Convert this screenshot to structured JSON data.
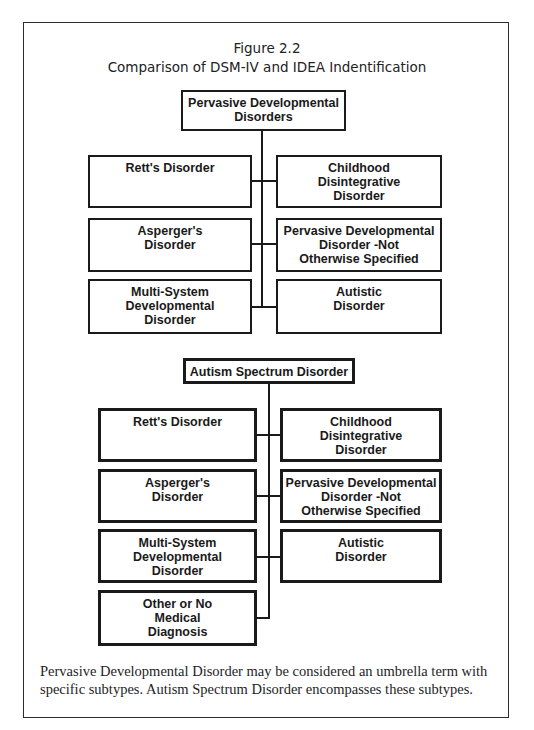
{
  "figure": {
    "number": "Figure 2.2",
    "title": "Comparison of DSM-IV and IDEA Indentification"
  },
  "dsm_diagram": {
    "root": "Pervasive Developmental\nDisorders",
    "children": [
      "Rett's Disorder",
      "Childhood\nDisintegrative\nDisorder",
      "Asperger's\nDisorder",
      "Pervasive Developmental\nDisorder -Not\nOtherwise Specified",
      "Multi-System\nDevelopmental\nDisorder",
      "Autistic\nDisorder"
    ]
  },
  "idea_diagram": {
    "root": "Autism Spectrum Disorder",
    "children": [
      "Rett's Disorder",
      "Childhood\nDisintegrative\nDisorder",
      "Asperger's\nDisorder",
      "Pervasive Developmental\nDisorder -Not\nOtherwise Specified",
      "Multi-System\nDevelopmental\nDisorder",
      "Autistic\nDisorder",
      "Other or No\nMedical\nDiagnosis"
    ]
  },
  "caption": "Pervasive Developmental Disorder may be considered an umbrella term with specific subtypes. Autism Spectrum Disorder encompasses these subtypes."
}
